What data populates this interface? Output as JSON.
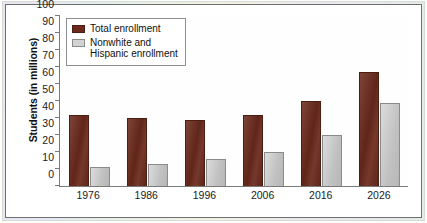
{
  "chart_data": {
    "type": "bar",
    "title": "",
    "xlabel": "",
    "ylabel": "Students (in millions)",
    "categories": [
      "1976",
      "1986",
      "1996",
      "2006",
      "2016",
      "2026"
    ],
    "series": [
      {
        "name": "Total enrollment",
        "color": "#6b2a1c",
        "values": [
          42,
          40,
          39,
          42,
          50,
          67
        ]
      },
      {
        "name": "Nonwhite and\nHispanic enrollment",
        "color": "#c9c9c9",
        "values": [
          11,
          13,
          16,
          20,
          30,
          49
        ]
      }
    ],
    "ylim": [
      0,
      100
    ],
    "yticks": [
      "0",
      "10",
      "20",
      "30",
      "40",
      "50",
      "60",
      "70",
      "80",
      "90",
      "100"
    ],
    "ytick_values": [
      0,
      10,
      20,
      30,
      40,
      50,
      60,
      70,
      80,
      90,
      100
    ],
    "grid": false,
    "legend_position": "top-left"
  },
  "legend": {
    "items": [
      {
        "label": "Total enrollment"
      },
      {
        "label": "Nonwhite and\nHispanic enrollment"
      }
    ]
  }
}
